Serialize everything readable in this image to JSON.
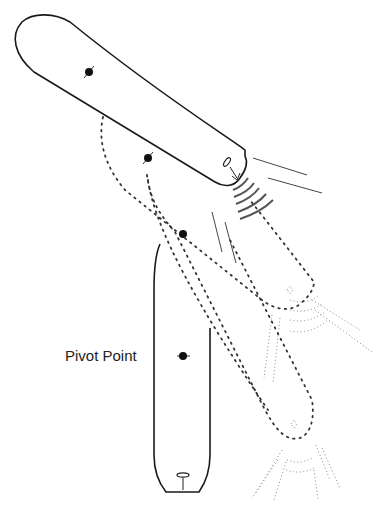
{
  "diagram": {
    "labels": {
      "pivot_point": "Pivot Point"
    },
    "colors": {
      "hull_stroke": "#1a1a1a",
      "ghost_stroke": "#333333",
      "wash_stroke": "#555555",
      "faint_wash": "#888888",
      "pivot_dot": "#111111",
      "background": "#ffffff"
    },
    "elements": [
      {
        "id": "hull-start",
        "style": "solid",
        "orientation": "diagonal"
      },
      {
        "id": "hull-ghost-1",
        "style": "dotted"
      },
      {
        "id": "hull-ghost-2",
        "style": "dotted"
      },
      {
        "id": "hull-end",
        "style": "solid",
        "orientation": "vertical"
      },
      {
        "id": "pivot-dot",
        "label_ref": "pivot_point"
      }
    ]
  }
}
